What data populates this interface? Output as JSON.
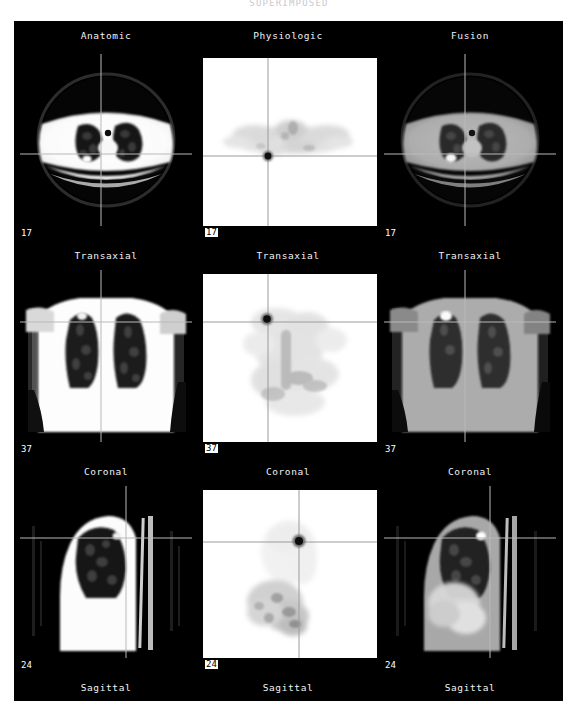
{
  "page": {
    "title": "SUPERIMPOSED"
  },
  "viewer": {
    "background_color": "#000000",
    "columns": [
      {
        "id": "anatomic",
        "label": "Anatomic",
        "modality": "ct"
      },
      {
        "id": "physiologic",
        "label": "Physiologic",
        "modality": "pet"
      },
      {
        "id": "fusion",
        "label": "Fusion",
        "modality": "fusion"
      }
    ],
    "rows": [
      {
        "id": "transaxial",
        "plane_label": "Transaxial",
        "slice_number": "17",
        "cells": [
          {
            "column": "anatomic",
            "slice_number": "17",
            "plane_label": "Transaxial"
          },
          {
            "column": "physiologic",
            "slice_number": "17",
            "plane_label": "Transaxial"
          },
          {
            "column": "fusion",
            "slice_number": "17",
            "plane_label": "Transaxial"
          }
        ]
      },
      {
        "id": "coronal",
        "plane_label": "Coronal",
        "slice_number": "37",
        "cells": [
          {
            "column": "anatomic",
            "slice_number": "37",
            "plane_label": "Coronal"
          },
          {
            "column": "physiologic",
            "slice_number": "37",
            "plane_label": "Coronal"
          },
          {
            "column": "fusion",
            "slice_number": "37",
            "plane_label": "Coronal"
          }
        ]
      },
      {
        "id": "sagittal",
        "plane_label": "Sagittal",
        "slice_number": "24",
        "cells": [
          {
            "column": "anatomic",
            "slice_number": "24",
            "plane_label": "Sagittal"
          },
          {
            "column": "physiologic",
            "slice_number": "24",
            "plane_label": "Sagittal"
          },
          {
            "column": "fusion",
            "slice_number": "24",
            "plane_label": "Sagittal"
          }
        ]
      }
    ],
    "crosshair": {
      "color_on_dark": "#b9b9b9",
      "color_on_light": "#9a9a9a",
      "transaxial": {
        "x_pct": 47,
        "y_pct": 58
      },
      "coronal": {
        "x_pct": 47,
        "y_pct": 31
      },
      "sagittal": {
        "x_pct": 62,
        "y_pct": 31
      }
    },
    "lesion": {
      "label": "focal-uptake",
      "color_pet": "#1a1a1a",
      "color_fusion": "#ffffff"
    }
  },
  "colors": {
    "panel_bg": "#000000",
    "text": "#f2f2f2",
    "pet_bg": "#ffffff",
    "page_bg": "#ffffff"
  }
}
